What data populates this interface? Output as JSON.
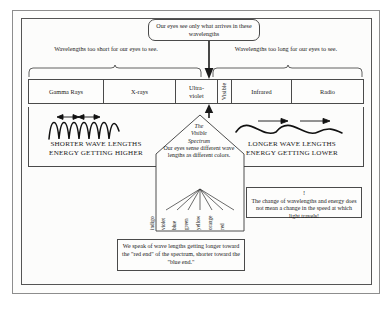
{
  "diagram": {
    "top_callout": "Our eyes see only what arrives in these wavelengths",
    "left_caption": "Wavelengths too short for our eyes to see.",
    "right_caption": "Wavelengths too long for our eyes to see.",
    "band": {
      "segments": [
        {
          "label": "Gamma Rays",
          "orientation": "horizontal"
        },
        {
          "label": "X-rays",
          "orientation": "horizontal"
        },
        {
          "label": "Ultra-violet",
          "line1": "Ultra-",
          "line2": "violet",
          "orientation": "horizontal"
        },
        {
          "label": "Visible",
          "orientation": "vertical"
        },
        {
          "label": "Infrared",
          "orientation": "horizontal"
        },
        {
          "label": "Radio",
          "orientation": "horizontal"
        }
      ]
    },
    "left_wave_caption_line1": "SHORTER WAVE LENGTHS",
    "left_wave_caption_line2": "ENERGY GETTING HIGHER",
    "right_wave_caption_line1": "LONGER WAVE LENGTHS",
    "right_wave_caption_line2": "ENERGY GETTING LOWER",
    "pentagon": {
      "heading_line1": "The",
      "heading_line2": "Visible",
      "heading_line3": "Spectrum",
      "body": "Our eyes sense different wave lengths as different colors."
    },
    "colors": [
      "indigo",
      "violet",
      "blue",
      "green",
      "yellow",
      "orange",
      "red"
    ],
    "bottom_note": "We speak of wave lengths getting longer toward the \"red end\" of the spectrum, shorter toward the \"blue end.\"",
    "speed_note_mark": "!",
    "speed_note": "The change of wavelengths and energy does not mean a change in the speed at which light travels!",
    "colors_hex": {
      "ink": "#1a1a1a",
      "rule": "#4a4a4a",
      "frame": "#8d8d8d",
      "paper": "#fdfdfc"
    }
  }
}
